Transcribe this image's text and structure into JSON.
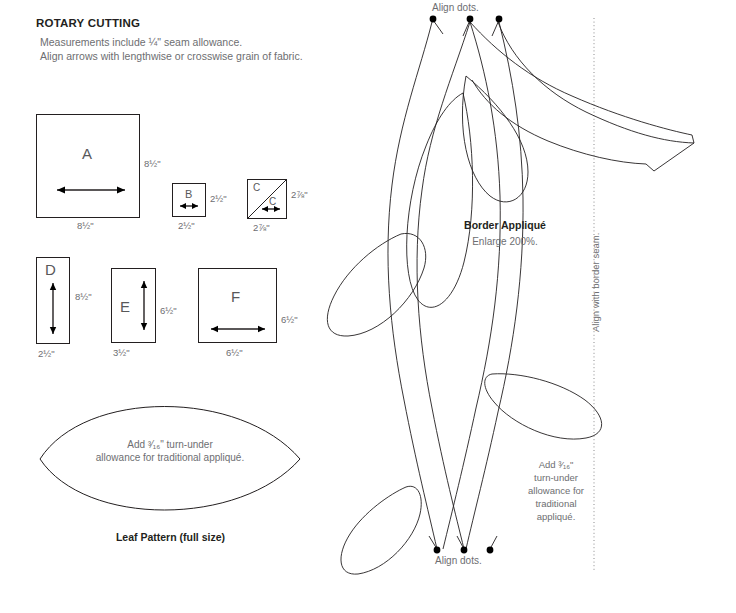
{
  "header": {
    "title": "ROTARY CUTTING",
    "line1": "Measurements include ¼\" seam allowance.",
    "line2": "Align arrows with lengthwise or crosswise grain of fabric."
  },
  "cutting_shapes": [
    {
      "id": "A",
      "letter": "A",
      "width_label": "8½\"",
      "height_label": "8½\"",
      "grain": "horizontal",
      "diagonal": false
    },
    {
      "id": "B",
      "letter": "B",
      "width_label": "2½\"",
      "height_label": "2½\"",
      "grain": "horizontal",
      "diagonal": false
    },
    {
      "id": "C",
      "letter": "C",
      "letter2": "C",
      "width_label": "2⅞\"",
      "height_label": "2⅞\"",
      "grain": "horizontal",
      "diagonal": true
    },
    {
      "id": "D",
      "letter": "D",
      "width_label": "2½\"",
      "height_label": "8½\"",
      "grain": "vertical",
      "diagonal": false
    },
    {
      "id": "E",
      "letter": "E",
      "width_label": "3½\"",
      "height_label": "6½\"",
      "grain": "vertical",
      "diagonal": false
    },
    {
      "id": "F",
      "letter": "F",
      "width_label": "6½\"",
      "height_label": "6½\"",
      "grain": "horizontal",
      "diagonal": false
    }
  ],
  "leaf_pattern": {
    "note_line1": "Add ³⁄₁₆\" turn-under",
    "note_line2": "allowance for traditional appliqué.",
    "caption": "Leaf Pattern (full size)"
  },
  "border_applique": {
    "title": "Border Appliqué",
    "subtitle": "Enlarge 200%.",
    "align_dots_top": "Align dots.",
    "align_dots_bottom": "Align dots.",
    "seam_label": "Align with border seam.",
    "turn_under_note": "Add ³⁄₁₆\" turn-under allowance for traditional appliqué.",
    "turn_under_lines": [
      "Add ³⁄₁₆\"",
      "turn-under",
      "allowance for",
      "traditional",
      "appliqué."
    ],
    "dot_count_top": 3,
    "dot_count_bottom": 3
  },
  "colors": {
    "ink": "#231f20",
    "text": "#6d6e71",
    "dotted_guide": "#8b8b8d",
    "background": "#ffffff"
  }
}
